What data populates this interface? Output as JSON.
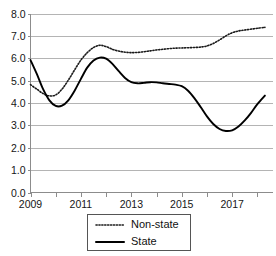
{
  "chart_data": {
    "type": "line",
    "title": "",
    "xlabel": "",
    "ylabel": "",
    "xlim": [
      2009,
      2018.6
    ],
    "ylim": [
      0.0,
      8.0
    ],
    "grid": true,
    "legend_position": "bottom-center",
    "y_ticks": [
      "8.0",
      "7.0",
      "6.0",
      "5.0",
      "4.0",
      "3.0",
      "2.0",
      "1.0",
      "0.0"
    ],
    "y_tick_values": [
      8.0,
      7.0,
      6.0,
      5.0,
      4.0,
      3.0,
      2.0,
      1.0,
      0.0
    ],
    "x_ticks": [
      "2009",
      "2011",
      "2013",
      "2015",
      "2017"
    ],
    "x_tick_values": [
      2009,
      2011,
      2013,
      2015,
      2017
    ],
    "x": [
      2009.0,
      2009.25,
      2009.5,
      2009.75,
      2010.0,
      2010.25,
      2010.5,
      2010.75,
      2011.0,
      2011.25,
      2011.5,
      2011.75,
      2012.0,
      2012.25,
      2012.5,
      2012.75,
      2013.0,
      2013.25,
      2013.5,
      2013.75,
      2014.0,
      2014.25,
      2014.5,
      2014.75,
      2015.0,
      2015.25,
      2015.5,
      2015.75,
      2016.0,
      2016.25,
      2016.5,
      2016.75,
      2017.0,
      2017.25,
      2017.5,
      2017.75,
      2018.0,
      2018.3
    ],
    "series": [
      {
        "name": "Non-state",
        "style": "dotted",
        "color": "#1a1a1a",
        "values": [
          4.82,
          4.62,
          4.42,
          4.32,
          4.36,
          4.62,
          5.02,
          5.48,
          5.92,
          6.25,
          6.48,
          6.58,
          6.52,
          6.4,
          6.32,
          6.27,
          6.25,
          6.26,
          6.29,
          6.33,
          6.37,
          6.4,
          6.43,
          6.45,
          6.46,
          6.47,
          6.48,
          6.5,
          6.55,
          6.66,
          6.82,
          7.0,
          7.14,
          7.22,
          7.26,
          7.3,
          7.34,
          7.38
        ]
      },
      {
        "name": "State",
        "style": "solid",
        "color": "#000000",
        "values": [
          5.92,
          5.3,
          4.62,
          4.12,
          3.87,
          3.88,
          4.12,
          4.55,
          5.08,
          5.58,
          5.9,
          6.03,
          5.98,
          5.75,
          5.42,
          5.12,
          4.93,
          4.88,
          4.9,
          4.93,
          4.92,
          4.88,
          4.85,
          4.82,
          4.75,
          4.55,
          4.22,
          3.82,
          3.4,
          3.06,
          2.84,
          2.75,
          2.78,
          2.95,
          3.22,
          3.56,
          3.95,
          4.33
        ]
      }
    ]
  },
  "legend": {
    "entries": [
      {
        "label": "Non-state",
        "style": "dotted"
      },
      {
        "label": "State",
        "style": "solid"
      }
    ]
  }
}
